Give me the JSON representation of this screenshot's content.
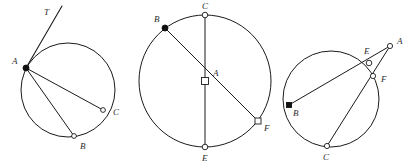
{
  "figure": {
    "background_color": "#ffffff",
    "stroke_color": "#1a1a1a",
    "label_color": "#2b2b2b",
    "width": 411,
    "height": 167
  },
  "diagrams": [
    {
      "id": "diagram-1",
      "name": "tangent-chord-circle",
      "circle": {
        "cx": 68,
        "cy": 90,
        "r": 47
      },
      "points": [
        {
          "key": "A",
          "label": "A",
          "x": 26,
          "y": 68,
          "marker": "filled-circle",
          "label_x": 12,
          "label_y": 64
        },
        {
          "key": "B",
          "label": "B",
          "x": 74,
          "y": 136,
          "marker": "open-circle",
          "label_x": 80,
          "label_y": 149
        },
        {
          "key": "C",
          "label": "C",
          "x": 103,
          "y": 110,
          "marker": "open-circle",
          "label_x": 113,
          "label_y": 115
        },
        {
          "key": "T",
          "label": "T",
          "x": 62,
          "y": 6,
          "marker": "none",
          "label_x": 44,
          "label_y": 15
        }
      ],
      "segments": [
        {
          "from": "A",
          "to": "B",
          "type": "chord"
        },
        {
          "from": "A",
          "to": "C",
          "type": "chord"
        },
        {
          "from": "A",
          "to": "T",
          "type": "tangent"
        }
      ]
    },
    {
      "id": "diagram-2",
      "name": "diameter-circle",
      "circle": {
        "cx": 205,
        "cy": 81,
        "r": 66
      },
      "points": [
        {
          "key": "A",
          "label": "A",
          "x": 205,
          "y": 81,
          "marker": "open-square",
          "label_x": 213,
          "label_y": 76
        },
        {
          "key": "B",
          "label": "B",
          "x": 165,
          "y": 28,
          "marker": "filled-circle",
          "label_x": 154,
          "label_y": 22
        },
        {
          "key": "C",
          "label": "C",
          "x": 205,
          "y": 15,
          "marker": "open-circle",
          "label_x": 202,
          "label_y": 9
        },
        {
          "key": "E",
          "label": "E",
          "x": 205,
          "y": 147,
          "marker": "open-circle",
          "label_x": 202,
          "label_y": 161
        },
        {
          "key": "F",
          "label": "F",
          "x": 258,
          "y": 121,
          "marker": "open-square",
          "label_x": 264,
          "label_y": 131
        }
      ],
      "segments": [
        {
          "from": "C",
          "to": "E",
          "type": "chord"
        },
        {
          "from": "B",
          "to": "F",
          "type": "chord"
        }
      ]
    },
    {
      "id": "diagram-3",
      "name": "two-secants-external-point-circle",
      "circle": {
        "cx": 331,
        "cy": 99,
        "r": 48
      },
      "points": [
        {
          "key": "A",
          "label": "A",
          "x": 390,
          "y": 46,
          "marker": "open-circle",
          "label_x": 397,
          "label_y": 44
        },
        {
          "key": "B",
          "label": "B",
          "x": 289,
          "y": 105,
          "marker": "filled-square",
          "label_x": 293,
          "label_y": 116
        },
        {
          "key": "C",
          "label": "C",
          "x": 327,
          "y": 146,
          "marker": "open-circle",
          "label_x": 323,
          "label_y": 160
        },
        {
          "key": "E",
          "label": "E",
          "x": 369,
          "y": 63,
          "marker": "open-circle",
          "label_x": 366,
          "label_y": 54
        },
        {
          "key": "F",
          "label": "F",
          "x": 373,
          "y": 76,
          "marker": "open-circle",
          "label_x": 381,
          "label_y": 81
        }
      ],
      "segments": [
        {
          "from": "A",
          "to": "B",
          "type": "secant"
        },
        {
          "from": "A",
          "to": "C",
          "type": "secant"
        }
      ]
    }
  ]
}
